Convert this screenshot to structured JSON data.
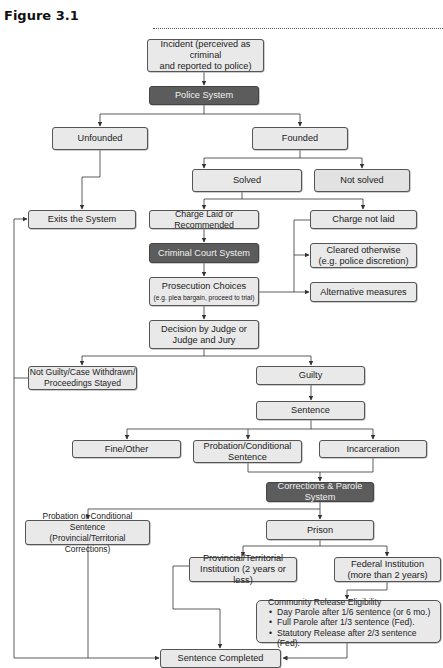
{
  "figure": {
    "title": "Figure 3.1"
  },
  "nodes": {
    "incident": {
      "line1": "Incident (perceived as criminal",
      "line2": "and reported to police)"
    },
    "police_system": {
      "label": "Police System"
    },
    "unfounded": {
      "label": "Unfounded"
    },
    "founded": {
      "label": "Founded"
    },
    "solved": {
      "label": "Solved"
    },
    "not_solved": {
      "label": "Not solved"
    },
    "exits_system": {
      "label": "Exits the System"
    },
    "charge_laid": {
      "label": "Charge Laid or Recommended"
    },
    "charge_not_laid": {
      "label": "Charge not laid"
    },
    "criminal_court_system": {
      "label": "Criminal Court System"
    },
    "cleared_otherwise": {
      "line1": "Cleared otherwise",
      "line2": "(e.g. police discretion)"
    },
    "prosecution_choices": {
      "line1": "Prosecution Choices",
      "line2": "(e.g. plea bargain, proceed to trial)"
    },
    "alternative_measures": {
      "label": "Alternative measures"
    },
    "decision": {
      "line1": "Decision by Judge or",
      "line2": "Judge and Jury"
    },
    "not_guilty": {
      "line1": "Not Guilty/Case Withdrawn/",
      "line2": "Proceedings Stayed"
    },
    "guilty": {
      "label": "Guilty"
    },
    "sentence": {
      "label": "Sentence"
    },
    "fine_other": {
      "label": "Fine/Other"
    },
    "probation_conditional": {
      "line1": "Probation/Conditional",
      "line2": "Sentence"
    },
    "incarceration": {
      "label": "Incarceration"
    },
    "corrections_parole": {
      "label": "Corrections & Parole System"
    },
    "probation_provincial": {
      "line1": "Probation or Conditional Sentence",
      "line2": "(Provincial/Territorial Corrections)"
    },
    "prison": {
      "label": "Prison"
    },
    "provincial_institution": {
      "line1": "Provincial/Territorial",
      "line2": "Institution (2 years or less)"
    },
    "federal_institution": {
      "line1": "Federal Institution",
      "line2": "(more than 2 years)"
    },
    "community_release": {
      "title": "Community Release Eligibility",
      "items": [
        "Day Parole after 1/6 sentence (or 6 mo.)",
        "Full Parole after 1/3 sentence (Fed).",
        "Statutory Release after 2/3 sentence (Fed)."
      ]
    },
    "sentence_completed": {
      "label": "Sentence Completed"
    }
  },
  "colors": {
    "box_fill": "#e9e9e9",
    "system_box_fill": "#5c5c5c",
    "border": "#555555",
    "line": "#333333"
  }
}
